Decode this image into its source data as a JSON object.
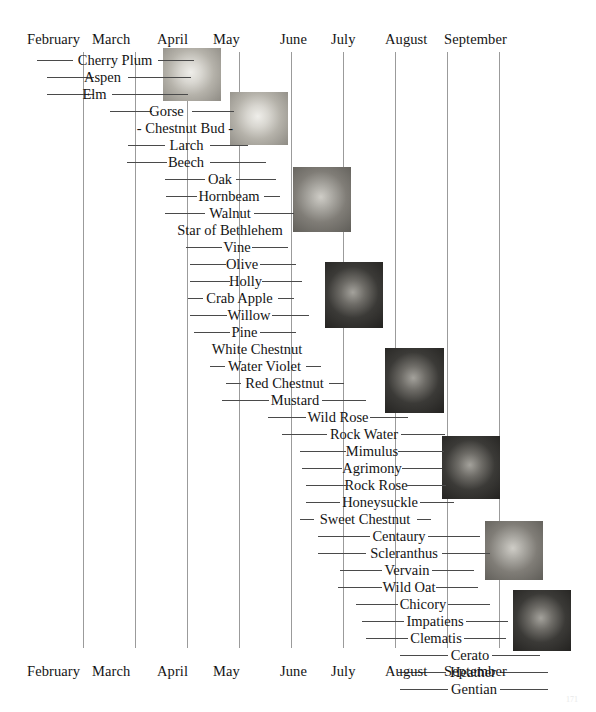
{
  "chart_data": {
    "type": "table",
    "xlabel": "",
    "ylabel": "",
    "months": [
      "February",
      "March",
      "April",
      "May",
      "June",
      "July",
      "August",
      "September"
    ],
    "month_positions_px": [
      27,
      92,
      157,
      213,
      280,
      331,
      385,
      444
    ],
    "gridlines_px": [
      83,
      135,
      187,
      239,
      291,
      343,
      395,
      447,
      499
    ],
    "categories": [
      "Cherry Plum",
      "Aspen",
      "Elm",
      "Gorse",
      "- Chestnut Bud -",
      "Larch",
      "Beech",
      "Oak",
      "Hornbeam",
      "Walnut",
      "Star of Bethlehem",
      "Vine",
      "Olive",
      "Holly",
      "Crab Apple",
      "Willow",
      "Pine",
      "White Chestnut",
      "Water Violet",
      "Red Chestnut",
      "Mustard",
      "Wild Rose",
      "Rock Water",
      "Mimulus",
      "Agrimony",
      "Rock Rose",
      "Honeysuckle",
      "Sweet Chestnut",
      "Centaury",
      "Scleranthus",
      "Vervain",
      "Wild Oat",
      "Chicory",
      "Impatiens",
      "Clematis",
      "Cerato",
      "Heather",
      "Gentian"
    ],
    "rows": [
      {
        "label": "Cherry Plum",
        "y": 52,
        "lx": 37,
        "lw": 36,
        "label_x": 74,
        "label_w": 82,
        "rx": 158,
        "rw": 36
      },
      {
        "label": "Aspen",
        "y": 69,
        "lx": 47,
        "lw": 47,
        "label_x": 80,
        "label_w": 45,
        "rx": 128,
        "rw": 63
      },
      {
        "label": "Elm",
        "y": 86,
        "lx": 47,
        "lw": 47,
        "label_x": 78,
        "label_w": 33,
        "rx": 112,
        "rw": 76
      },
      {
        "label": "Gorse",
        "y": 103,
        "lx": 110,
        "lw": 42,
        "label_x": 144,
        "label_w": 45,
        "rx": 192,
        "rw": 42
      },
      {
        "label": "- Chestnut Bud -",
        "y": 120,
        "lx": 0,
        "lw": 0,
        "label_x": 130,
        "label_w": 110,
        "rx": 0,
        "rw": 0
      },
      {
        "label": "Larch",
        "y": 137,
        "lx": 128,
        "lw": 37,
        "label_x": 164,
        "label_w": 45,
        "rx": 210,
        "rw": 38
      },
      {
        "label": "Beech",
        "y": 154,
        "lx": 127,
        "lw": 40,
        "label_x": 162,
        "label_w": 48,
        "rx": 210,
        "rw": 56
      },
      {
        "label": "Oak",
        "y": 171,
        "lx": 165,
        "lw": 40,
        "label_x": 203,
        "label_w": 34,
        "rx": 236,
        "rw": 40
      },
      {
        "label": "Hornbeam",
        "y": 188,
        "lx": 166,
        "lw": 31,
        "label_x": 192,
        "label_w": 74,
        "rx": 264,
        "rw": 16
      },
      {
        "label": "Walnut",
        "y": 205,
        "lx": 165,
        "lw": 40,
        "label_x": 204,
        "label_w": 52,
        "rx": 254,
        "rw": 40
      },
      {
        "label": "Star of Bethlehem",
        "y": 222,
        "lx": 0,
        "lw": 0,
        "label_x": 174,
        "label_w": 112,
        "rx": 0,
        "rw": 0
      },
      {
        "label": "Vine",
        "y": 239,
        "lx": 186,
        "lw": 36,
        "label_x": 220,
        "label_w": 34,
        "rx": 252,
        "rw": 36
      },
      {
        "label": "Olive",
        "y": 256,
        "lx": 190,
        "lw": 36,
        "label_x": 222,
        "label_w": 40,
        "rx": 260,
        "rw": 36
      },
      {
        "label": "Holly",
        "y": 273,
        "lx": 190,
        "lw": 40,
        "label_x": 226,
        "label_w": 39,
        "rx": 262,
        "rw": 40
      },
      {
        "label": "Crab Apple",
        "y": 290,
        "lx": 188,
        "lw": 15,
        "label_x": 200,
        "label_w": 79,
        "rx": 278,
        "rw": 16
      },
      {
        "label": "Willow",
        "y": 307,
        "lx": 190,
        "lw": 37,
        "label_x": 224,
        "label_w": 50,
        "rx": 272,
        "rw": 37
      },
      {
        "label": "Pine",
        "y": 324,
        "lx": 194,
        "lw": 36,
        "label_x": 228,
        "label_w": 33,
        "rx": 260,
        "rw": 36
      },
      {
        "label": "White Chestnut",
        "y": 341,
        "lx": 0,
        "lw": 0,
        "label_x": 208,
        "label_w": 98,
        "rx": 0,
        "rw": 0
      },
      {
        "label": "Water Violet",
        "y": 358,
        "lx": 210,
        "lw": 15,
        "label_x": 222,
        "label_w": 85,
        "rx": 306,
        "rw": 15
      },
      {
        "label": "Red Chestnut",
        "y": 375,
        "lx": 226,
        "lw": 15,
        "label_x": 238,
        "label_w": 93,
        "rx": 329,
        "rw": 15
      },
      {
        "label": "Mustard",
        "y": 392,
        "lx": 222,
        "lw": 47,
        "label_x": 266,
        "label_w": 58,
        "rx": 322,
        "rw": 44
      },
      {
        "label": "Wild Rose",
        "y": 409,
        "lx": 268,
        "lw": 38,
        "label_x": 304,
        "label_w": 68,
        "rx": 370,
        "rw": 38
      },
      {
        "label": "Rock Water",
        "y": 426,
        "lx": 282,
        "lw": 45,
        "label_x": 325,
        "label_w": 78,
        "rx": 401,
        "rw": 44
      },
      {
        "label": "Mimulus",
        "y": 443,
        "lx": 300,
        "lw": 46,
        "label_x": 344,
        "label_w": 56,
        "rx": 398,
        "rw": 46
      },
      {
        "label": "Agrimony",
        "y": 460,
        "lx": 302,
        "lw": 40,
        "label_x": 340,
        "label_w": 64,
        "rx": 402,
        "rw": 40
      },
      {
        "label": "Rock Rose",
        "y": 477,
        "lx": 306,
        "lw": 40,
        "label_x": 344,
        "label_w": 64,
        "rx": 406,
        "rw": 40
      },
      {
        "label": "Honeysuckle",
        "y": 494,
        "lx": 306,
        "lw": 34,
        "label_x": 338,
        "label_w": 84,
        "rx": 420,
        "rw": 34
      },
      {
        "label": "Sweet Chestnut",
        "y": 511,
        "lx": 300,
        "lw": 14,
        "label_x": 312,
        "label_w": 106,
        "rx": 417,
        "rw": 14
      },
      {
        "label": "Centaury",
        "y": 528,
        "lx": 318,
        "lw": 52,
        "label_x": 368,
        "label_w": 62,
        "rx": 428,
        "rw": 52
      },
      {
        "label": "Scleranthus",
        "y": 545,
        "lx": 318,
        "lw": 48,
        "label_x": 364,
        "label_w": 80,
        "rx": 442,
        "rw": 48
      },
      {
        "label": "Vervain",
        "y": 562,
        "lx": 340,
        "lw": 42,
        "label_x": 380,
        "label_w": 54,
        "rx": 432,
        "rw": 42
      },
      {
        "label": "Wild Oat",
        "y": 579,
        "lx": 338,
        "lw": 44,
        "label_x": 380,
        "label_w": 58,
        "rx": 436,
        "rw": 42
      },
      {
        "label": "Chicory",
        "y": 596,
        "lx": 356,
        "lw": 42,
        "label_x": 396,
        "label_w": 54,
        "rx": 448,
        "rw": 42
      },
      {
        "label": "Impatiens",
        "y": 613,
        "lx": 362,
        "lw": 42,
        "label_x": 402,
        "label_w": 66,
        "rx": 466,
        "rw": 42
      },
      {
        "label": "Clematis",
        "y": 630,
        "lx": 366,
        "lw": 42,
        "label_x": 406,
        "label_w": 60,
        "rx": 464,
        "rw": 42
      },
      {
        "label": "Cerato",
        "y": 647,
        "lx": 400,
        "lw": 48,
        "label_x": 446,
        "label_w": 48,
        "rx": 492,
        "rw": 48
      },
      {
        "label": "Heather",
        "y": 664,
        "lx": 398,
        "lw": 48,
        "label_x": 444,
        "label_w": 58,
        "rx": 500,
        "rw": 48
      },
      {
        "label": "Gentian",
        "y": 681,
        "lx": 400,
        "lw": 48,
        "label_x": 446,
        "label_w": 56,
        "rx": 500,
        "rw": 48
      }
    ]
  },
  "axis": {
    "top": {
      "months": [
        {
          "label": "February",
          "x": 27
        },
        {
          "label": "March",
          "x": 92
        },
        {
          "label": "April",
          "x": 157
        },
        {
          "label": "May",
          "x": 213
        },
        {
          "label": "June",
          "x": 280
        },
        {
          "label": "July",
          "x": 331
        },
        {
          "label": "August",
          "x": 385
        },
        {
          "label": "September",
          "x": 444
        }
      ]
    },
    "bottom": {
      "months": [
        {
          "label": "February",
          "x": 27
        },
        {
          "label": "March",
          "x": 92
        },
        {
          "label": "April",
          "x": 157
        },
        {
          "label": "May",
          "x": 213
        },
        {
          "label": "June",
          "x": 280
        },
        {
          "label": "July",
          "x": 331
        },
        {
          "label": "August",
          "x": 385
        },
        {
          "label": "September",
          "x": 444
        }
      ]
    }
  },
  "gridlines": [
    {
      "x": 83
    },
    {
      "x": 135
    },
    {
      "x": 187
    },
    {
      "x": 239
    },
    {
      "x": 291
    },
    {
      "x": 343
    },
    {
      "x": 395
    },
    {
      "x": 447
    },
    {
      "x": 499
    }
  ],
  "photos": [
    {
      "name": "photo-cherry-plum",
      "x": 163,
      "y": 48,
      "w": 58,
      "h": 53,
      "tone": "light"
    },
    {
      "name": "photo-chestnut-bud",
      "x": 230,
      "y": 92,
      "w": 58,
      "h": 53,
      "tone": "light"
    },
    {
      "name": "photo-walnut",
      "x": 293,
      "y": 167,
      "w": 58,
      "h": 65,
      "tone": "mid"
    },
    {
      "name": "photo-vine",
      "x": 325,
      "y": 262,
      "w": 58,
      "h": 66,
      "tone": "dark"
    },
    {
      "name": "photo-wild-rose",
      "x": 385,
      "y": 348,
      "w": 59,
      "h": 65,
      "tone": "dark"
    },
    {
      "name": "photo-honeysuckle",
      "x": 442,
      "y": 436,
      "w": 58,
      "h": 63,
      "tone": "dark"
    },
    {
      "name": "photo-chicory",
      "x": 485,
      "y": 521,
      "w": 58,
      "h": 59,
      "tone": "mid"
    },
    {
      "name": "photo-gentian",
      "x": 513,
      "y": 590,
      "w": 58,
      "h": 61,
      "tone": "dark"
    }
  ],
  "page": {
    "number": "171"
  },
  "colors": {
    "background": "#ffffff",
    "text": "#141414",
    "rule": "#4a4a4a",
    "gridline": "#9b9b9b"
  }
}
